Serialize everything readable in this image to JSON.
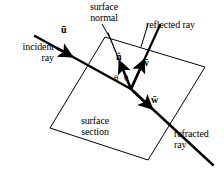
{
  "figure": {
    "kind": "optics-ray-diagram",
    "background_color": "#ffffff",
    "stroke_color": "#000000",
    "width": 224,
    "height": 175
  },
  "labels": {
    "incident_ray": "incident\nray",
    "surface_normal": "surface\nnormal",
    "reflected_ray": "reflected ray",
    "refracted_ray": "refracted\nray",
    "surface_section": "surface\nsection"
  },
  "vectors": {
    "u": "ū",
    "n": "n̂",
    "v": "v̄",
    "w": "w̄"
  },
  "angles": {
    "theta_incidence": "θ",
    "theta_reflection": "θ"
  },
  "geometry": {
    "surface_plane_corners": "105,37 205,67 148,160 50,128",
    "intersection_point": "131,89",
    "incident_start": "35,36",
    "reflected_end": "160,25",
    "normal_top": "108,33",
    "refracted_end": "213,165"
  }
}
